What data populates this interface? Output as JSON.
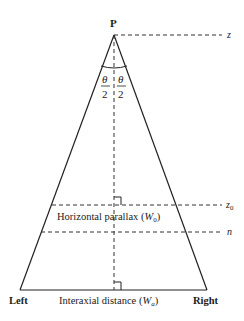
{
  "diagram": {
    "apex_label": "P",
    "angle_numerator": "θ",
    "angle_denominator": "2",
    "horizontal_labels": {
      "z": "z",
      "z0": "z",
      "z0_sub": "0",
      "n": "n"
    },
    "horizontal_parallax": {
      "prefix": "Horizontal parallax (",
      "var": "W",
      "sub": "0",
      "suffix": ")"
    },
    "interaxial_distance": {
      "prefix": "Interaxial distance (",
      "var": "W",
      "sub": "a",
      "suffix": ")"
    },
    "left_label": "Left",
    "right_label": "Right"
  }
}
